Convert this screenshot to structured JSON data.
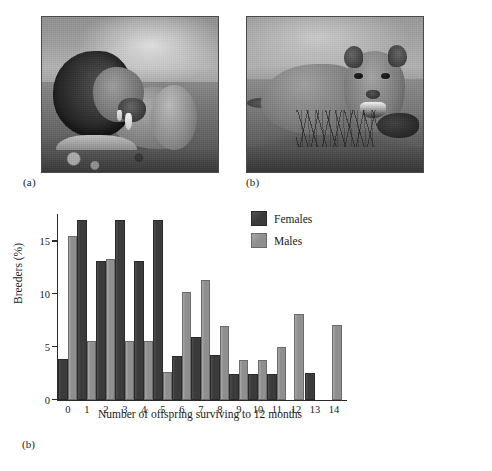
{
  "figure": {
    "panels": [
      {
        "id": "a",
        "caption": "(a)",
        "subject": "male-lion-photograph",
        "alt": "Black and white photograph of a male lion with a dark mane lying on dry ground"
      },
      {
        "id": "b",
        "caption": "(b)",
        "subject": "lioness-photograph",
        "alt": "Black and white photograph of a lioness lying behind dry grass facing the camera"
      }
    ],
    "chart_caption": "(b)"
  },
  "chart_data": {
    "type": "bar",
    "title": "",
    "xlabel": "Number of offspring surviving to 12 months",
    "ylabel": "Breeders (%)",
    "categories": [
      "0",
      "1",
      "2",
      "3",
      "4",
      "5",
      "6",
      "7",
      "8",
      "9",
      "10",
      "11",
      "12",
      "13",
      "14"
    ],
    "series": [
      {
        "name": "Females",
        "color": "#3b3b3b",
        "values": [
          3.7,
          16.8,
          12.9,
          16.8,
          12.9,
          16.8,
          3.9,
          5.7,
          4.0,
          2.2,
          2.2,
          2.2,
          0,
          2.3,
          0
        ]
      },
      {
        "name": "Males",
        "color": "#8f8f8f",
        "values": [
          15.3,
          5.4,
          13.1,
          5.4,
          5.4,
          2.4,
          10.0,
          11.1,
          6.8,
          3.6,
          3.6,
          4.8,
          7.9,
          0,
          6.9
        ]
      }
    ],
    "yticks": [
      0,
      5,
      10,
      15
    ],
    "ylim": [
      0,
      17.5
    ],
    "grid": false,
    "legend_position": "top-right",
    "legend": [
      "Females",
      "Males"
    ]
  }
}
